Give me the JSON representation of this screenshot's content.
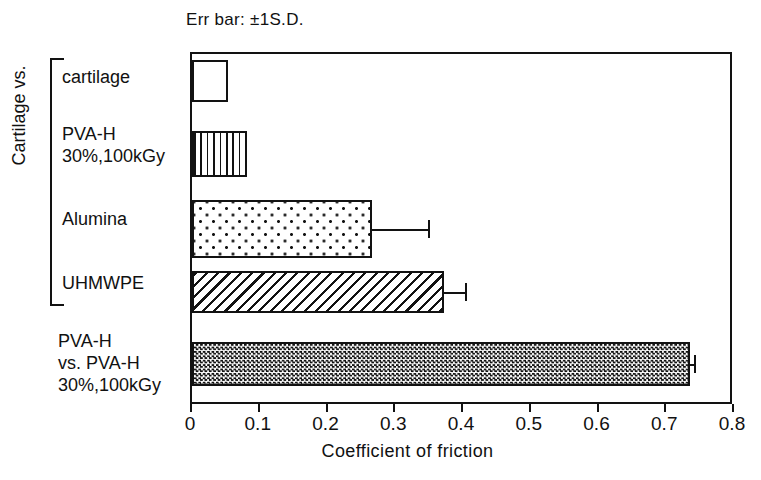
{
  "chart_data": {
    "type": "bar",
    "orientation": "horizontal",
    "title": "",
    "annotation": "Err bar: ±1S.D.",
    "xlabel": "Coefficient of friction",
    "ylabel": "",
    "group_label": "Cartilage vs.",
    "xlim": [
      0,
      0.8
    ],
    "xticks": [
      "0",
      "0.1",
      "0.2",
      "0.3",
      "0.4",
      "0.5",
      "0.6",
      "0.7",
      "0.8"
    ],
    "xtick_values": [
      0,
      0.1,
      0.2,
      0.3,
      0.4,
      0.5,
      0.6,
      0.7,
      0.8
    ],
    "grid": false,
    "legend": false,
    "categories": [
      "cartilage",
      "PVA-H\n30%,100kGy",
      "Alumina",
      "UHMWPE",
      "PVA-H\nvs. PVA-H\n30%,100kGy"
    ],
    "values": [
      0.053,
      0.081,
      0.266,
      0.372,
      0.735
    ],
    "errors": [
      0,
      0,
      0.082,
      0.031,
      0.006
    ],
    "fills": [
      "blank",
      "vertical-stripes",
      "dots",
      "diagonal-hatch",
      "checkerboard"
    ],
    "group_bracket_categories": [
      "cartilage",
      "PVA-H 30%,100kGy",
      "Alumina",
      "UHMWPE"
    ],
    "colors": {
      "line": "#121212",
      "background": "#ffffff"
    }
  }
}
